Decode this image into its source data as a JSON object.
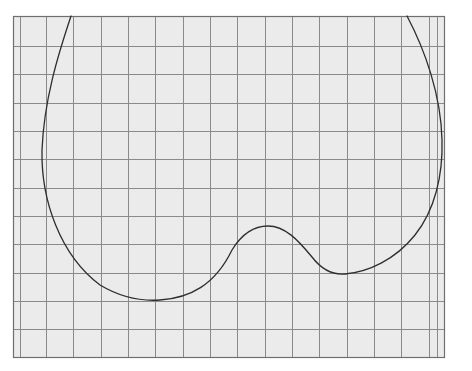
{
  "diagram": {
    "type": "curve-on-graph-paper",
    "background_color": "#ffffff",
    "paper": {
      "fill": "#ebebeb",
      "left": 13,
      "top": 16,
      "right": 444,
      "bottom": 357,
      "border_color": "#6f6f6f",
      "grid_color": "#8a8a8a",
      "rows": 12,
      "horizontal_lines": [
        46,
        74,
        103,
        131,
        159,
        188,
        216,
        244,
        273,
        301,
        329
      ],
      "vertical_lines": [
        20,
        46,
        73,
        101,
        128,
        155,
        183,
        210,
        237,
        265,
        292,
        319,
        347,
        374,
        401,
        429,
        437
      ]
    },
    "curve": {
      "stroke": "#2e2e2e",
      "stroke_width": 1.3,
      "description": "Open heart-like curve: enters at top-left, sweeps down the left side to a minimum near the bottom, rises to a small central bump, dips into a second valley, then sweeps up the right side and exits at top-right.",
      "path": "M 71 16 C 58 55, 44 100, 42 150 C 41 200, 60 255, 100 285 C 125 300, 145 301, 160 300 C 190 298, 215 285, 232 250 C 243 232, 255 226, 268 226 C 285 226, 298 240, 312 257 C 322 270, 334 275, 345 274 C 368 272, 395 260, 415 235 C 435 210, 443 175, 442 140 C 441 95, 425 50, 407 16",
      "key_points": [
        {
          "label": "start-top-left",
          "x": 71,
          "y": 16
        },
        {
          "label": "leftmost",
          "x": 42,
          "y": 150
        },
        {
          "label": "left-minimum",
          "x": 155,
          "y": 300
        },
        {
          "label": "central-bump-peak",
          "x": 268,
          "y": 226
        },
        {
          "label": "right-valley",
          "x": 345,
          "y": 274
        },
        {
          "label": "rightmost",
          "x": 442,
          "y": 140
        },
        {
          "label": "end-top-right",
          "x": 407,
          "y": 16
        }
      ]
    }
  }
}
